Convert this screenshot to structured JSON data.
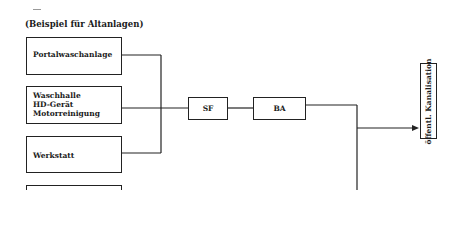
{
  "caption": "(Beispiel für Altanlagen)",
  "sources": [
    {
      "label": "Portalwaschanlage"
    },
    {
      "label": "Waschhalle\nHD-Gerät\nMotorreinigung"
    },
    {
      "label": "Werkstatt"
    },
    {
      "label": ""
    }
  ],
  "process": {
    "sf": "SF",
    "ba": "BA"
  },
  "destination": "öffentl. Kanalisation",
  "colors": {
    "line": "#222222",
    "background": "#ffffff"
  }
}
